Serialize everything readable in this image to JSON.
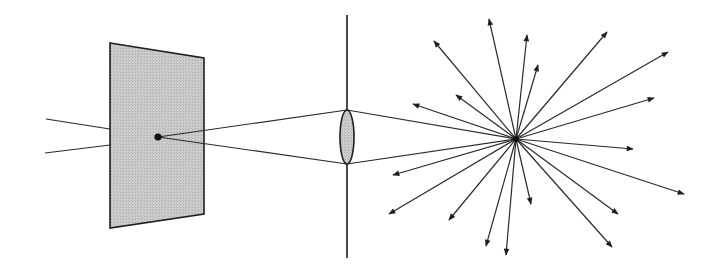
{
  "diagram": {
    "type": "optical-ray-diagram",
    "colors": {
      "line": "#2a2a2a",
      "screen_fill": "#c8c8c8",
      "lens_fill": "#cfcfcf",
      "background": "#ffffff"
    },
    "screen": {
      "corners": [
        [
          110,
          43
        ],
        [
          204,
          58
        ],
        [
          204,
          214
        ],
        [
          110,
          228
        ]
      ]
    },
    "source_point": [
      158,
      137
    ],
    "incoming_rays": [
      {
        "from": [
          46,
          119
        ],
        "to": [
          110,
          129
        ]
      },
      {
        "from": [
          45,
          153
        ],
        "to": [
          110,
          145
        ]
      }
    ],
    "lens": {
      "axis_x": 347,
      "axis_y_top": 15,
      "axis_y_bottom": 258,
      "center": [
        347,
        137
      ],
      "rx": 7,
      "ry": 27
    },
    "focus_point": [
      516,
      139
    ],
    "scatter_rays": [
      [
        489,
        19
      ],
      [
        527,
        35
      ],
      [
        538,
        65
      ],
      [
        607,
        32
      ],
      [
        668,
        52
      ],
      [
        654,
        98
      ],
      [
        434,
        41
      ],
      [
        456,
        95
      ],
      [
        413,
        104
      ],
      [
        633,
        149
      ],
      [
        684,
        194
      ],
      [
        618,
        214
      ],
      [
        612,
        247
      ],
      [
        531,
        204
      ],
      [
        506,
        255
      ],
      [
        486,
        246
      ],
      [
        449,
        220
      ],
      [
        389,
        214
      ],
      [
        393,
        175
      ]
    ]
  }
}
